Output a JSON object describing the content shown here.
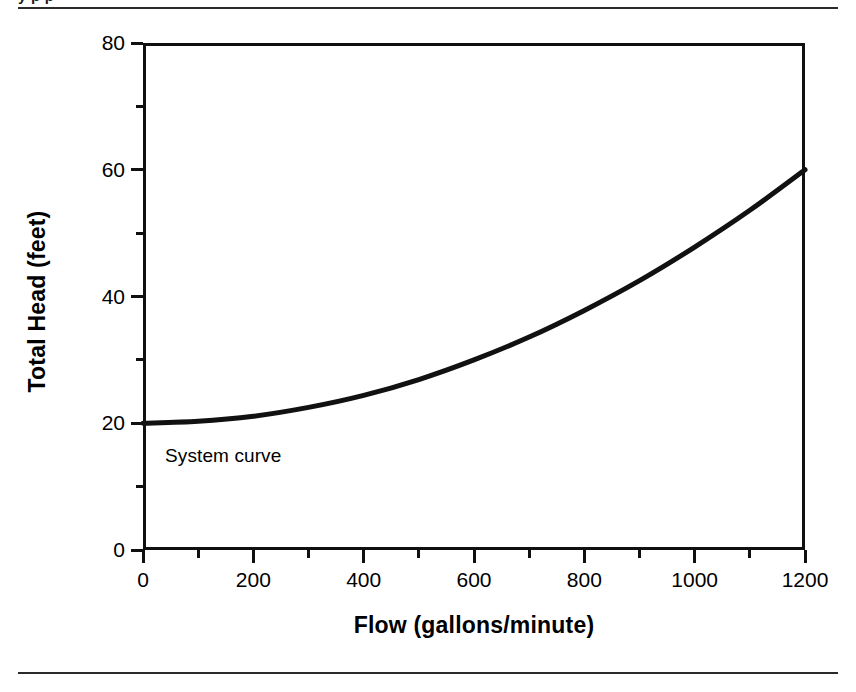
{
  "page": {
    "clipped_caption_text": "y            p                                                    p"
  },
  "chart_data": {
    "type": "line",
    "title": "",
    "xlabel": "Flow (gallons/minute)",
    "ylabel": "Total Head (feet)",
    "xlim": [
      0,
      1200
    ],
    "ylim": [
      0,
      80
    ],
    "grid": false,
    "legend": "none",
    "x_ticks": [
      0,
      200,
      400,
      600,
      800,
      1000,
      1200
    ],
    "x_tick_labels": [
      "0",
      "200",
      "400",
      "600",
      "800",
      "1000",
      "1200"
    ],
    "x_minor_ticks": [
      100,
      300,
      500,
      700,
      900,
      1100
    ],
    "y_ticks": [
      0,
      20,
      40,
      60,
      80
    ],
    "y_tick_labels": [
      "0",
      "20",
      "40",
      "60",
      "80"
    ],
    "y_minor_ticks": [
      10,
      30,
      50,
      70
    ],
    "annotations": [
      {
        "text": "System curve",
        "x": 40,
        "y": 16.5
      }
    ],
    "series": [
      {
        "name": "System curve",
        "color": "#111111",
        "line_width": 5,
        "x": [
          0,
          100,
          200,
          300,
          400,
          500,
          600,
          700,
          800,
          900,
          1000,
          1100,
          1200
        ],
        "values": [
          20.0,
          20.3,
          21.1,
          22.5,
          24.4,
          26.9,
          30.0,
          33.6,
          37.8,
          42.5,
          47.8,
          53.6,
          60.0
        ]
      }
    ]
  },
  "colors": {
    "ink": "#111111",
    "rule": "#2b2b2b",
    "background": "#ffffff"
  }
}
